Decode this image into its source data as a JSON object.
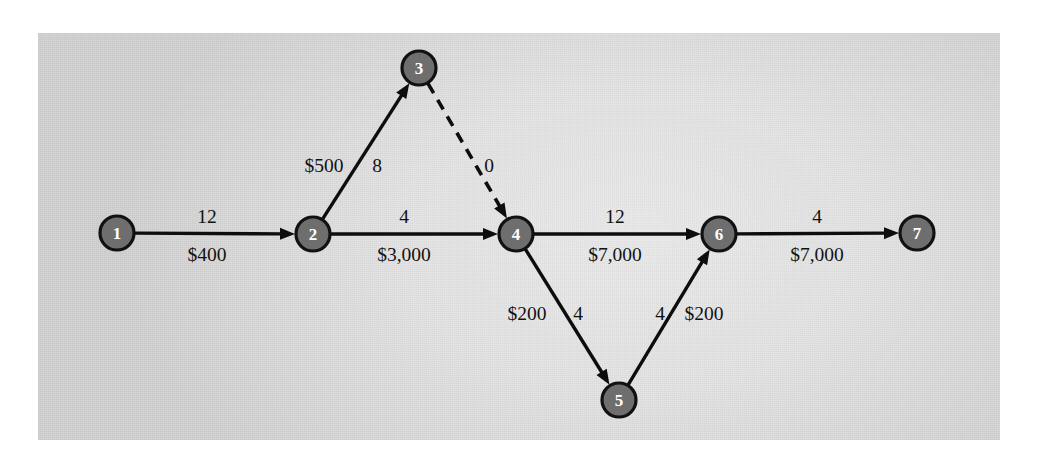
{
  "diagram": {
    "panel": {
      "background_color": "#e4e4e4",
      "border_color": "#ffffff"
    },
    "node_style": {
      "fill_color": "#6e6e6e",
      "stroke_color": "#111111",
      "label_color": "#ffffff",
      "radius": 17
    },
    "edge_style": {
      "line_color": "#0d0d0d",
      "label_color": "#111111"
    },
    "nodes": [
      {
        "id": "1",
        "label": "1",
        "x": 117,
        "y": 233
      },
      {
        "id": "2",
        "label": "2",
        "x": 313,
        "y": 234
      },
      {
        "id": "3",
        "label": "3",
        "x": 419,
        "y": 68
      },
      {
        "id": "4",
        "label": "4",
        "x": 516,
        "y": 234
      },
      {
        "id": "5",
        "label": "5",
        "x": 619,
        "y": 400
      },
      {
        "id": "6",
        "label": "6",
        "x": 719,
        "y": 234
      },
      {
        "id": "7",
        "label": "7",
        "x": 917,
        "y": 233
      }
    ],
    "edges": [
      {
        "id": "edge-1-2",
        "from": "1",
        "to": "2",
        "style": "solid",
        "time_label": "12",
        "cost_label": "$400",
        "time_pos": {
          "x": 207,
          "y": 223
        },
        "cost_pos": {
          "x": 207,
          "y": 261
        }
      },
      {
        "id": "edge-2-3",
        "from": "2",
        "to": "3",
        "style": "solid",
        "time_label": "8",
        "cost_label": "$500",
        "time_pos": {
          "x": 377,
          "y": 172
        },
        "cost_pos": {
          "x": 324,
          "y": 172
        }
      },
      {
        "id": "edge-3-4",
        "from": "3",
        "to": "4",
        "style": "dashed",
        "time_label": "0",
        "cost_label": "",
        "time_pos": {
          "x": 489,
          "y": 172
        },
        "cost_pos": null
      },
      {
        "id": "edge-2-4",
        "from": "2",
        "to": "4",
        "style": "solid",
        "time_label": "4",
        "cost_label": "$3,000",
        "time_pos": {
          "x": 404,
          "y": 223
        },
        "cost_pos": {
          "x": 404,
          "y": 261
        }
      },
      {
        "id": "edge-4-6",
        "from": "4",
        "to": "6",
        "style": "solid",
        "time_label": "12",
        "cost_label": "$7,000",
        "time_pos": {
          "x": 615,
          "y": 223
        },
        "cost_pos": {
          "x": 615,
          "y": 261
        }
      },
      {
        "id": "edge-6-7",
        "from": "6",
        "to": "7",
        "style": "solid",
        "time_label": "4",
        "cost_label": "$7,000",
        "time_pos": {
          "x": 817,
          "y": 223
        },
        "cost_pos": {
          "x": 817,
          "y": 261
        }
      },
      {
        "id": "edge-4-5",
        "from": "4",
        "to": "5",
        "style": "solid",
        "time_label": "4",
        "cost_label": "$200",
        "time_pos": {
          "x": 578,
          "y": 320
        },
        "cost_pos": {
          "x": 527,
          "y": 320
        }
      },
      {
        "id": "edge-5-6",
        "from": "5",
        "to": "6",
        "style": "solid",
        "time_label": "4",
        "cost_label": "$200",
        "time_pos": {
          "x": 660,
          "y": 320
        },
        "cost_pos": {
          "x": 704,
          "y": 320
        }
      }
    ]
  }
}
